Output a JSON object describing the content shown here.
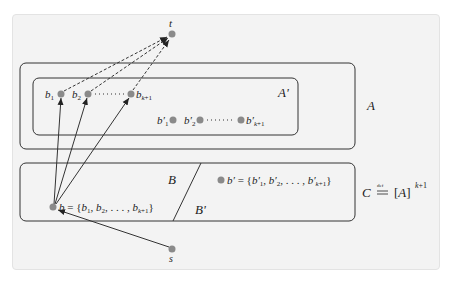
{
  "figure": {
    "nodes": {
      "t": {
        "label": "t",
        "x": 172,
        "y": 34
      },
      "s": {
        "label": "s",
        "x": 172,
        "y": 249
      },
      "b": {
        "label": "b = {b1, b2, ..., bk+1}",
        "x": 53,
        "y": 207
      },
      "b_prime": {
        "label": "b' = {b'1, b'2, ..., b'k+1}",
        "x": 221,
        "y": 180
      },
      "b1": {
        "label": "b1",
        "x": 61,
        "y": 94
      },
      "b2": {
        "label": "b2",
        "x": 88,
        "y": 94
      },
      "bk1": {
        "label": "bk+1",
        "x": 131,
        "y": 94
      },
      "bp1": {
        "label": "b'1",
        "x": 173,
        "y": 120
      },
      "bp2": {
        "label": "b'2",
        "x": 200,
        "y": 120
      },
      "bpk1": {
        "label": "b'k+1",
        "x": 241,
        "y": 120
      }
    },
    "regions": {
      "A": {
        "label": "A"
      },
      "A_prime": {
        "label": "A'"
      },
      "B": {
        "label": "B"
      },
      "B_prime": {
        "label": "B'"
      },
      "C": {
        "label": "C",
        "definition": "C ≝ [A]^(k+1)",
        "def_symbol": "def",
        "rhs": "[A]",
        "exponent": "k+1"
      }
    },
    "edges": {
      "dashed": [
        "b1 → t",
        "b2 → t",
        "bk+1 → t"
      ],
      "solid": [
        "b → b1",
        "b → b2",
        "b → bk+1",
        "s → b"
      ]
    },
    "ellipsis": "· · · · ·",
    "colors": {
      "node": "#8a8a8a",
      "stroke": "#333333",
      "panel": "#f3f3f3"
    }
  }
}
